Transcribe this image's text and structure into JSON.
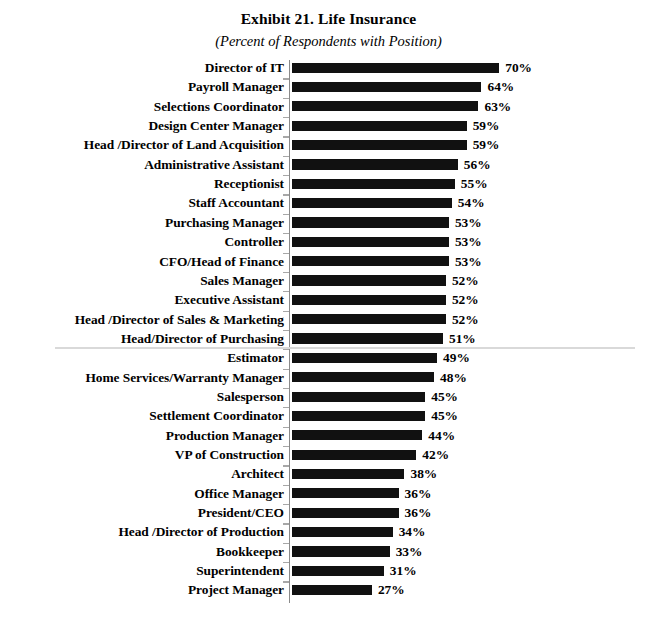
{
  "chart_data": {
    "type": "bar",
    "orientation": "horizontal",
    "title": "Exhibit 21. Life Insurance",
    "subtitle": "(Percent of Respondents with Position)",
    "xlabel": "",
    "ylabel": "",
    "value_suffix": "%",
    "xlim": [
      0,
      70
    ],
    "grid": false,
    "legend": null,
    "bar_color": "#111111",
    "axis_color": "#8a8a8a",
    "divider_color": "#d9d9d9",
    "divider_after_index": 14,
    "divider_note": "separator between positions at 50% or above and below 50%",
    "categories": [
      "Director of IT",
      "Payroll Manager",
      "Selections Coordinator",
      "Design Center Manager",
      "Head /Director of Land Acquisition",
      "Administrative Assistant",
      "Receptionist",
      "Staff Accountant",
      "Purchasing Manager",
      "Controller",
      "CFO/Head of Finance",
      "Sales Manager",
      "Executive Assistant",
      "Head /Director of Sales & Marketing",
      "Head/Director of Purchasing",
      "Estimator",
      "Home Services/Warranty Manager",
      "Salesperson",
      "Settlement Coordinator",
      "Production Manager",
      "VP of Construction",
      "Architect",
      "Office Manager",
      "President/CEO",
      "Head /Director of Production",
      "Bookkeeper",
      "Superintendent",
      "Project Manager"
    ],
    "values": [
      70,
      64,
      63,
      59,
      59,
      56,
      55,
      54,
      53,
      53,
      53,
      52,
      52,
      52,
      51,
      49,
      48,
      45,
      45,
      44,
      42,
      38,
      36,
      36,
      34,
      33,
      31,
      27
    ],
    "value_labels": [
      "70%",
      "64%",
      "63%",
      "59%",
      "59%",
      "56%",
      "55%",
      "54%",
      "53%",
      "53%",
      "53%",
      "52%",
      "52%",
      "52%",
      "51%",
      "49%",
      "48%",
      "45%",
      "45%",
      "44%",
      "42%",
      "38%",
      "36%",
      "36%",
      "34%",
      "33%",
      "31%",
      "27%"
    ]
  }
}
